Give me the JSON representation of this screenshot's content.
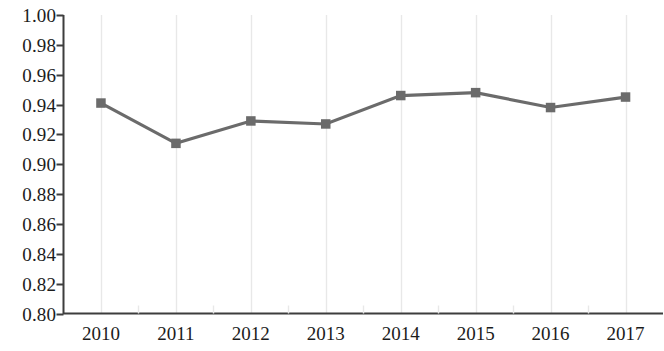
{
  "chart_data": {
    "type": "line",
    "title": "",
    "subtitle": "",
    "xlabel": "",
    "ylabel": "",
    "categories": [
      "2010",
      "2011",
      "2012",
      "2013",
      "2014",
      "2015",
      "2016",
      "2017"
    ],
    "series": [
      {
        "name": "",
        "values": [
          0.941,
          0.914,
          0.929,
          0.927,
          0.946,
          0.948,
          0.938,
          0.945
        ]
      }
    ],
    "ylim": [
      0.8,
      1.0
    ],
    "ytick_step": 0.02,
    "ytick_labels": [
      "1.00",
      "0.98",
      "0.96",
      "0.94",
      "0.92",
      "0.90",
      "0.88",
      "0.86",
      "0.84",
      "0.82",
      "0.80"
    ],
    "ytick_values": [
      1.0,
      0.98,
      0.96,
      0.94,
      0.92,
      0.9,
      0.88,
      0.86,
      0.84,
      0.82,
      0.8
    ],
    "grid": "vertical-only",
    "legend": "none",
    "marker": "square",
    "colors": {
      "line": "#6b6b6b",
      "marker": "#6b6b6b",
      "axis": "#3d3d3d",
      "gridline": "#e8e8e8",
      "text": "#1c1c1c",
      "background": "#ffffff"
    }
  }
}
